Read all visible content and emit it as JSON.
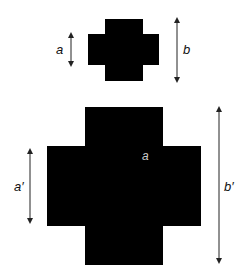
{
  "diagram": {
    "small_cross": {
      "label_a": "a",
      "label_b": "b"
    },
    "large_cross": {
      "label_a_prime": "a′",
      "label_b_prime": "b′",
      "inner_label": "a"
    },
    "colors": {
      "shape": "#000000",
      "background": "#ffffff",
      "inner_label": "#cccccc"
    }
  }
}
